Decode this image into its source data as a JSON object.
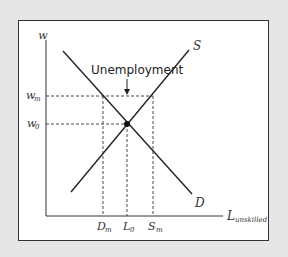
{
  "diagram": {
    "y_axis_label": "w",
    "x_axis_label_main": "L",
    "x_axis_label_sub": "unskilled",
    "supply_label": "S",
    "demand_label": "D",
    "annotation": "Unemployment",
    "y_ticks": {
      "wm_main": "w",
      "wm_sub": "m",
      "w0_main": "w",
      "w0_sub": "0"
    },
    "x_ticks": {
      "dm_main": "D",
      "dm_sub": "m",
      "l0_main": "L",
      "l0_sub": "0",
      "sm_main": "S",
      "sm_sub": "m"
    },
    "colors": {
      "background": "#e6e6e6",
      "panel": "#ffffff",
      "line": "#222222"
    }
  }
}
